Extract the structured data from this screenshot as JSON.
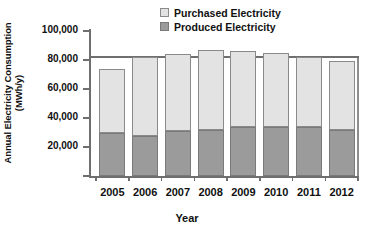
{
  "chart_data": {
    "type": "bar",
    "subtype": "stacked",
    "title": "",
    "xlabel": "Year",
    "ylabel": "Annual Electricity Consumption (MWh/y)",
    "ylabel_line1": "Annual Electricity Consumption",
    "ylabel_line2": "(MWh/y)",
    "categories": [
      "2005",
      "2006",
      "2007",
      "2008",
      "2009",
      "2010",
      "2011",
      "2012"
    ],
    "series": [
      {
        "name": "Produced Electricity",
        "color": "#9b9b9b",
        "values": [
          30000,
          27500,
          31000,
          32000,
          33500,
          33500,
          34000,
          31500
        ]
      },
      {
        "name": "Purchased Electricity",
        "color": "#e3e3e3",
        "values": [
          44000,
          54500,
          53500,
          55000,
          52500,
          51500,
          48000,
          47500
        ]
      }
    ],
    "totals": [
      74000,
      82000,
      84500,
      87000,
      86000,
      85000,
      82000,
      79000
    ],
    "ylim": [
      0,
      100000
    ],
    "yticks": [
      0,
      20000,
      40000,
      60000,
      80000,
      100000
    ],
    "ytick_labels": [
      "",
      "20,000",
      "40,000",
      "60,000",
      "80,000",
      "100,000"
    ],
    "grid": true,
    "gridlines_shown": [
      80000
    ],
    "legend_position": "top-right",
    "legend_order": [
      "Purchased Electricity",
      "Produced Electricity"
    ]
  },
  "legend": {
    "items": [
      {
        "label": "Purchased Electricity",
        "color": "#e3e3e3"
      },
      {
        "label": "Produced Electricity",
        "color": "#9b9b9b"
      }
    ]
  }
}
